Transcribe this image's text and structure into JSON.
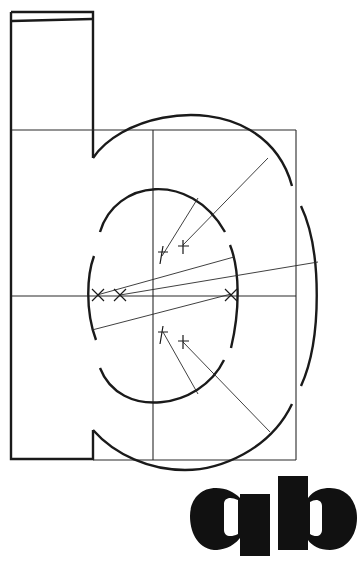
{
  "diagram": {
    "sample_text": "qb",
    "colors": {
      "ink": "#1a1a1a",
      "background": "#ffffff"
    }
  }
}
